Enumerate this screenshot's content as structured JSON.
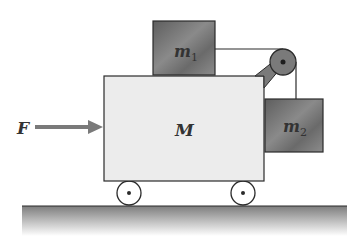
{
  "diagram": {
    "type": "physics-free-body-setup",
    "labels": {
      "force": "F",
      "cart": "M",
      "block1": "m",
      "block1_sub": "1",
      "block2": "m",
      "block2_sub": "2"
    },
    "colors": {
      "cart_fill": "#ececec",
      "block_fill": "#6f6f6f",
      "pulley_fill": "#7a7a7a",
      "arrow": "#7a7a7a",
      "outline": "#2b2b2b",
      "ground_top": "#7d7d7d",
      "ground_bottom": "#ffffff"
    }
  }
}
